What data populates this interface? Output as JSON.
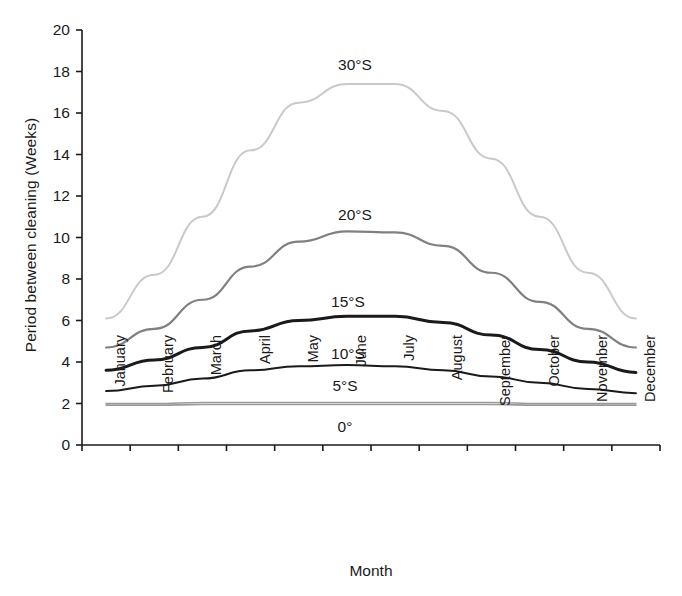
{
  "chart_data": {
    "type": "line",
    "title": "",
    "xlabel": "Month",
    "ylabel": "Period between cleaning (Weeks)",
    "categories": [
      "January",
      "February",
      "March",
      "April",
      "May",
      "June",
      "July",
      "August",
      "September",
      "October",
      "November",
      "December"
    ],
    "ylim": [
      0,
      20
    ],
    "ytick_labels": [
      "0",
      "2",
      "4",
      "6",
      "8",
      "10",
      "12",
      "14",
      "16",
      "18",
      "20"
    ],
    "ytick_values": [
      0,
      2,
      4,
      6,
      8,
      10,
      12,
      14,
      16,
      18,
      20
    ],
    "grid": false,
    "legend_position": "inline-annotations",
    "series": [
      {
        "name": "30°S",
        "color": "#c9c9c9",
        "width": 2.0,
        "values": [
          6.1,
          8.2,
          11.0,
          14.2,
          16.5,
          17.4,
          17.4,
          16.1,
          13.8,
          11.0,
          8.3,
          6.1
        ]
      },
      {
        "name": "20°S",
        "color": "#808080",
        "width": 2.2,
        "values": [
          4.7,
          5.6,
          7.0,
          8.6,
          9.8,
          10.3,
          10.25,
          9.6,
          8.3,
          6.9,
          5.6,
          4.7
        ]
      },
      {
        "name": "15°S",
        "color": "#1a1a1a",
        "width": 3.0,
        "values": [
          3.6,
          4.1,
          4.7,
          5.5,
          6.0,
          6.2,
          6.2,
          5.9,
          5.3,
          4.6,
          4.0,
          3.5
        ]
      },
      {
        "name": "10°S",
        "color": "#1a1a1a",
        "width": 2.0,
        "values": [
          2.6,
          2.85,
          3.2,
          3.6,
          3.8,
          3.85,
          3.8,
          3.6,
          3.3,
          3.0,
          2.7,
          2.5
        ]
      },
      {
        "name": "5°S",
        "color": "#9a9a9a",
        "width": 1.6,
        "values": [
          2.0,
          2.0,
          2.05,
          2.05,
          2.05,
          2.05,
          2.05,
          2.05,
          2.05,
          2.0,
          2.0,
          2.0
        ]
      },
      {
        "name": "0°",
        "color": "#9a9a9a",
        "width": 1.6,
        "values": [
          1.92,
          1.92,
          1.95,
          1.95,
          1.95,
          1.95,
          1.95,
          1.95,
          1.95,
          1.92,
          1.92,
          1.92
        ]
      }
    ],
    "annotations": [
      {
        "text": "30°S",
        "x_px": 355,
        "y_px": 56
      },
      {
        "text": "20°S",
        "x_px": 355,
        "y_px": 206
      },
      {
        "text": "15°S",
        "x_px": 348,
        "y_px": 293
      },
      {
        "text": "10°S",
        "x_px": 348,
        "y_px": 345
      },
      {
        "text": "5°S",
        "x_px": 345,
        "y_px": 377
      },
      {
        "text": "0°",
        "x_px": 345,
        "y_px": 418
      }
    ]
  }
}
